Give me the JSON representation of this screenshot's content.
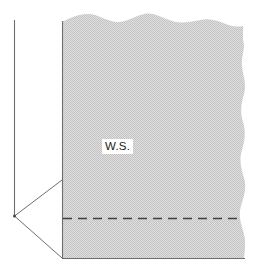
{
  "figure": {
    "type": "cross-section-diagram",
    "background_color": "#ffffff",
    "line_color": "#555555",
    "fill_color": "#d2d2d2",
    "dash_color": "#3c3c3c",
    "labels": [
      {
        "id": "water-surface",
        "text": "W.S.",
        "x": 102,
        "y": 139,
        "background": "#ffffff",
        "color": "#1a1a1a"
      }
    ],
    "elements": {
      "vertical_axis": {
        "name": "vertical-axis-line",
        "x": 14,
        "y_top": 20,
        "y_bottom": 216
      },
      "apex_vertex": {
        "name": "apex-vertex",
        "x": 14,
        "y": 216
      },
      "upper_wedge_line": {
        "name": "upper-wedge-line",
        "x1": 14,
        "y1": 216,
        "x2": 62,
        "y2": 180
      },
      "lower_wedge_line": {
        "name": "lower-wedge-line",
        "x1": 14,
        "y1": 216,
        "x2": 62,
        "y2": 258
      },
      "section_left_edge": {
        "name": "section-left-edge",
        "x": 62,
        "y_top": 22,
        "y_bottom": 258
      },
      "section_bottom_edge": {
        "name": "section-bottom-edge",
        "y": 258,
        "x_left": 62,
        "x_right": 245
      },
      "section_top_edge": {
        "name": "section-top-wavy-edge",
        "style": "wavy",
        "y_mean": 24
      },
      "section_right_edge": {
        "name": "section-right-wavy-edge",
        "style": "wavy",
        "x_mean": 243
      },
      "dashed_line": {
        "name": "dashed-water-level-line",
        "y": 218,
        "x_left": 63,
        "x_right": 243,
        "style": "dashed"
      },
      "shaded_body": {
        "name": "shaded-section-body",
        "pattern": "stipple-halftone"
      }
    }
  }
}
